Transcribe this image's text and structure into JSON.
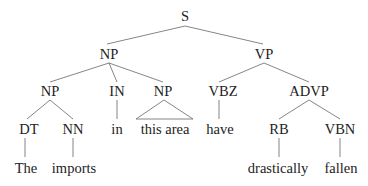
{
  "tree": {
    "nodes": [
      {
        "id": "S",
        "label": "S",
        "x": 185,
        "y": 16
      },
      {
        "id": "NP1",
        "label": "NP",
        "x": 109,
        "y": 54
      },
      {
        "id": "VP",
        "label": "VP",
        "x": 264,
        "y": 54
      },
      {
        "id": "NP2",
        "label": "NP",
        "x": 50,
        "y": 91
      },
      {
        "id": "IN",
        "label": "IN",
        "x": 117,
        "y": 91
      },
      {
        "id": "NP3",
        "label": "NP",
        "x": 163,
        "y": 91
      },
      {
        "id": "VBZ",
        "label": "VBZ",
        "x": 223,
        "y": 91
      },
      {
        "id": "ADVP",
        "label": "ADVP",
        "x": 309,
        "y": 91
      },
      {
        "id": "DT",
        "label": "DT",
        "x": 29,
        "y": 129
      },
      {
        "id": "NN",
        "label": "NN",
        "x": 73,
        "y": 129
      },
      {
        "id": "w_in",
        "label": "in",
        "x": 117,
        "y": 129
      },
      {
        "id": "w_thisarea",
        "label": "this area",
        "x": 165,
        "y": 129
      },
      {
        "id": "w_have",
        "label": "have",
        "x": 220,
        "y": 129
      },
      {
        "id": "RB",
        "label": "RB",
        "x": 279,
        "y": 129
      },
      {
        "id": "VBN",
        "label": "VBN",
        "x": 340,
        "y": 129
      },
      {
        "id": "w_the",
        "label": "The",
        "x": 26,
        "y": 168
      },
      {
        "id": "w_imports",
        "label": "imports",
        "x": 74,
        "y": 168
      },
      {
        "id": "w_drastically",
        "label": "drastically",
        "x": 278,
        "y": 168
      },
      {
        "id": "w_fallen",
        "label": "fallen",
        "x": 341,
        "y": 168
      }
    ],
    "edges": [
      [
        "S",
        "NP1"
      ],
      [
        "S",
        "VP"
      ],
      [
        "NP1",
        "NP2"
      ],
      [
        "NP1",
        "IN"
      ],
      [
        "NP1",
        "NP3"
      ],
      [
        "VP",
        "VBZ"
      ],
      [
        "VP",
        "ADVP"
      ],
      [
        "NP2",
        "DT"
      ],
      [
        "NP2",
        "NN"
      ],
      [
        "IN",
        "w_in"
      ],
      [
        "VBZ",
        "w_have"
      ],
      [
        "ADVP",
        "RB"
      ],
      [
        "ADVP",
        "VBN"
      ],
      [
        "DT",
        "w_the"
      ],
      [
        "NN",
        "w_imports"
      ],
      [
        "RB",
        "w_drastically"
      ],
      [
        "VBN",
        "w_fallen"
      ]
    ],
    "triangles": [
      [
        "NP3",
        "w_thisarea"
      ]
    ]
  }
}
